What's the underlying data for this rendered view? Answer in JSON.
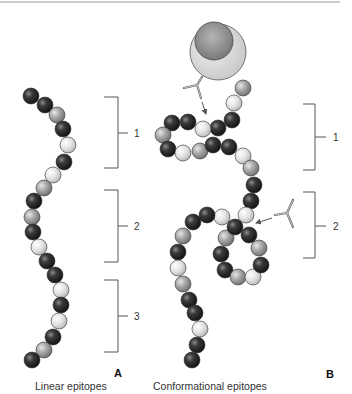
{
  "figure": {
    "panels": [
      {
        "id": "A",
        "letter": "A",
        "caption": "Linear epitopes",
        "brackets": [
          {
            "label": "1"
          },
          {
            "label": "2"
          },
          {
            "label": "3"
          }
        ]
      },
      {
        "id": "B",
        "letter": "B",
        "caption": "Conformational epitopes",
        "brackets": [
          {
            "label": "1"
          },
          {
            "label": "2"
          }
        ]
      }
    ],
    "colors": {
      "dark_bead": "#2e2e2e",
      "mid_bead": "#9a9a9a",
      "light_bead": "#dcdcdc",
      "cell_outer": "#d4d4d4",
      "cell_nucleus": "#8c8c8c",
      "line": "#555555"
    }
  }
}
